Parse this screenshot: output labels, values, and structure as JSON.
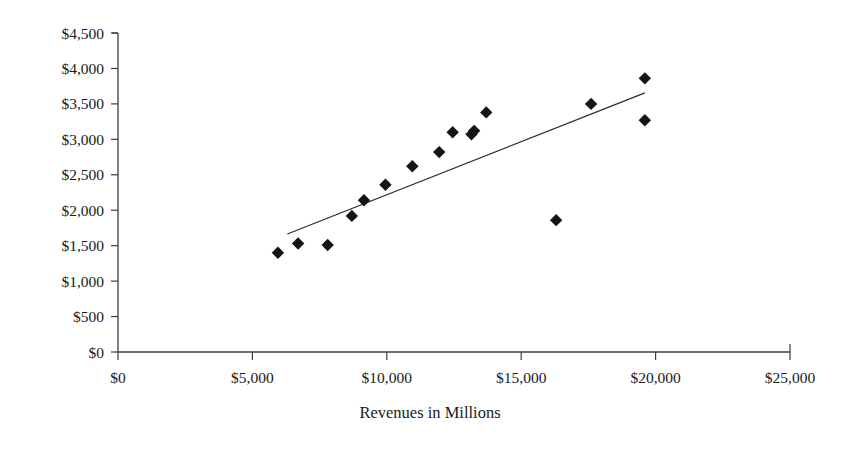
{
  "chart_data": {
    "type": "scatter",
    "title": "",
    "subtitle": "",
    "xlabel": "Revenues in Millions",
    "ylabel": "",
    "xlim": [
      0,
      25000
    ],
    "ylim": [
      0,
      4500
    ],
    "grid": false,
    "legend": null,
    "x_tick_labels": [
      "$0",
      "$5,000",
      "$10,000",
      "$15,000",
      "$20,000",
      "$25,000"
    ],
    "x_tick_values": [
      0,
      5000,
      10000,
      15000,
      20000,
      25000
    ],
    "y_tick_labels": [
      "$0",
      "$500",
      "$1,000",
      "$1,500",
      "$2,000",
      "$2,500",
      "$3,000",
      "$3,500",
      "$4,000",
      "$4,500"
    ],
    "y_tick_values": [
      0,
      500,
      1000,
      1500,
      2000,
      2500,
      3000,
      3500,
      4000,
      4500
    ],
    "marker_shape": "diamond",
    "marker_color": "#151515",
    "points": [
      {
        "x": 5950,
        "y": 1400
      },
      {
        "x": 6700,
        "y": 1530
      },
      {
        "x": 7800,
        "y": 1510
      },
      {
        "x": 8700,
        "y": 1920
      },
      {
        "x": 9150,
        "y": 2140
      },
      {
        "x": 9950,
        "y": 2360
      },
      {
        "x": 10950,
        "y": 2620
      },
      {
        "x": 11950,
        "y": 2820
      },
      {
        "x": 12450,
        "y": 3100
      },
      {
        "x": 13150,
        "y": 3070
      },
      {
        "x": 13250,
        "y": 3120
      },
      {
        "x": 13700,
        "y": 3380
      },
      {
        "x": 16300,
        "y": 1860
      },
      {
        "x": 17600,
        "y": 3500
      },
      {
        "x": 19600,
        "y": 3860
      },
      {
        "x": 19600,
        "y": 3270
      }
    ],
    "trendline": {
      "type": "linear",
      "x_start": 6300,
      "y_start": 1665,
      "x_end": 19600,
      "y_end": 3655,
      "color": "#2b2b2b"
    }
  }
}
